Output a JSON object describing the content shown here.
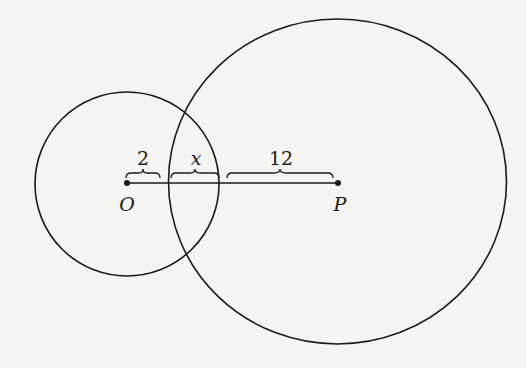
{
  "diagram": {
    "background": "#f4f4f2",
    "stroke_color": "#1a1a1a",
    "circles": [
      {
        "name": "circle-O",
        "center_label": "O",
        "cx": 127,
        "cy": 183,
        "r": 92
      },
      {
        "name": "circle-P",
        "center_label": "P",
        "cx": 337,
        "cy": 182,
        "r": 166
      }
    ],
    "points": [
      {
        "name": "point-O",
        "label": "O",
        "x": 127,
        "y": 183
      },
      {
        "name": "point-P",
        "label": "P",
        "x": 338,
        "y": 183
      }
    ],
    "segment": {
      "from": "O",
      "to": "P"
    },
    "segment_labels": [
      {
        "name": "segment-label-2",
        "text": "2",
        "italic": false
      },
      {
        "name": "segment-label-x",
        "text": "x",
        "italic": true
      },
      {
        "name": "segment-label-12",
        "text": "12",
        "italic": false
      }
    ]
  }
}
